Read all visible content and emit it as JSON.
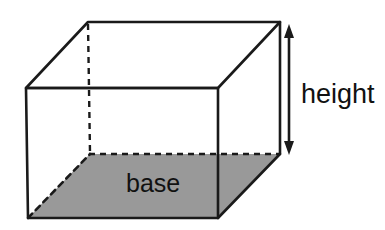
{
  "figure": {
    "background_color": "#ffffff",
    "edge_color": "#1a1a1a",
    "base_fill_color": "#999999",
    "labels": {
      "height": "height",
      "base": "base"
    },
    "geometry": {
      "front_top_left": [
        26,
        88
      ],
      "front_top_right": [
        218,
        88
      ],
      "front_bottom_left": [
        28,
        218
      ],
      "front_bottom_right": [
        218,
        218
      ],
      "back_top_left": [
        88,
        22
      ],
      "back_top_right": [
        280,
        22
      ],
      "back_bottom_left": [
        90,
        154
      ],
      "back_bottom_right": [
        280,
        154
      ]
    },
    "dimension_arrow": {
      "name": "height-arrow",
      "x": 289,
      "y_top": 25,
      "y_bottom": 154,
      "double_headed": true
    },
    "hidden_edges": [
      "back-vertical-left",
      "back-bottom-horizontal"
    ]
  }
}
